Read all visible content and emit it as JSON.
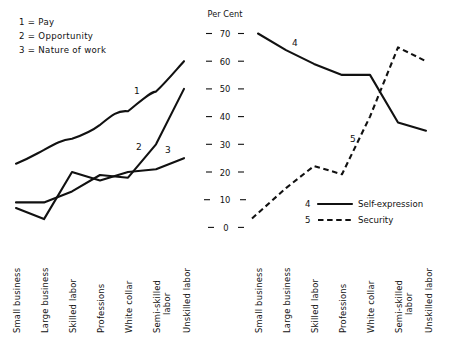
{
  "figure": {
    "axis_title": "Per Cent",
    "key_lines": [
      "1 = Pay",
      "2 = Opportunity",
      "3 = Nature of work"
    ],
    "y_ticks": [
      "0",
      "10",
      "20",
      "30",
      "40",
      "50",
      "60",
      "70"
    ],
    "categories": [
      "Small business",
      "Large business",
      "Skilled labor",
      "Professions",
      "White collar",
      "Semi-skilled labor",
      "Unskilled labor"
    ],
    "curve_labels": {
      "one": "1",
      "two": "2",
      "three": "3",
      "four": "4",
      "five": "5"
    },
    "legend": [
      {
        "key": "4",
        "label": "Self-expression",
        "style": "solid"
      },
      {
        "key": "5",
        "label": "Security",
        "style": "dashed"
      }
    ]
  },
  "chart_data": [
    {
      "type": "line",
      "panel": "left",
      "title": "",
      "xlabel": "",
      "ylabel": "Per Cent",
      "ylim": [
        0,
        70
      ],
      "grid": false,
      "legend_position": "top-left-key",
      "categories": [
        "Small business",
        "Large business",
        "Skilled labor",
        "Professions",
        "White collar",
        "Semi-skilled labor",
        "Unskilled labor"
      ],
      "series": [
        {
          "name": "Pay",
          "key": "1",
          "style": "solid",
          "values": [
            23,
            28,
            32,
            37,
            42,
            49,
            60
          ]
        },
        {
          "name": "Opportunity",
          "key": "2",
          "style": "solid",
          "values": [
            9,
            9,
            13,
            19,
            18,
            30,
            50
          ]
        },
        {
          "name": "Nature of work",
          "key": "3",
          "style": "solid",
          "values": [
            7,
            3,
            20,
            17,
            20,
            21,
            25
          ]
        }
      ]
    },
    {
      "type": "line",
      "panel": "right",
      "title": "",
      "xlabel": "",
      "ylabel": "Per Cent",
      "ylim": [
        0,
        70
      ],
      "grid": false,
      "legend_position": "bottom-right",
      "categories": [
        "Small business",
        "Large business",
        "Skilled labor",
        "Professions",
        "White collar",
        "Semi-skilled labor",
        "Unskilled labor"
      ],
      "series": [
        {
          "name": "Self-expression",
          "key": "4",
          "style": "solid",
          "values": [
            70,
            64,
            59,
            55,
            55,
            38,
            35
          ]
        },
        {
          "name": "Security",
          "key": "5",
          "style": "dashed",
          "values": [
            4,
            14,
            22,
            19,
            40,
            65,
            60
          ]
        }
      ]
    }
  ]
}
